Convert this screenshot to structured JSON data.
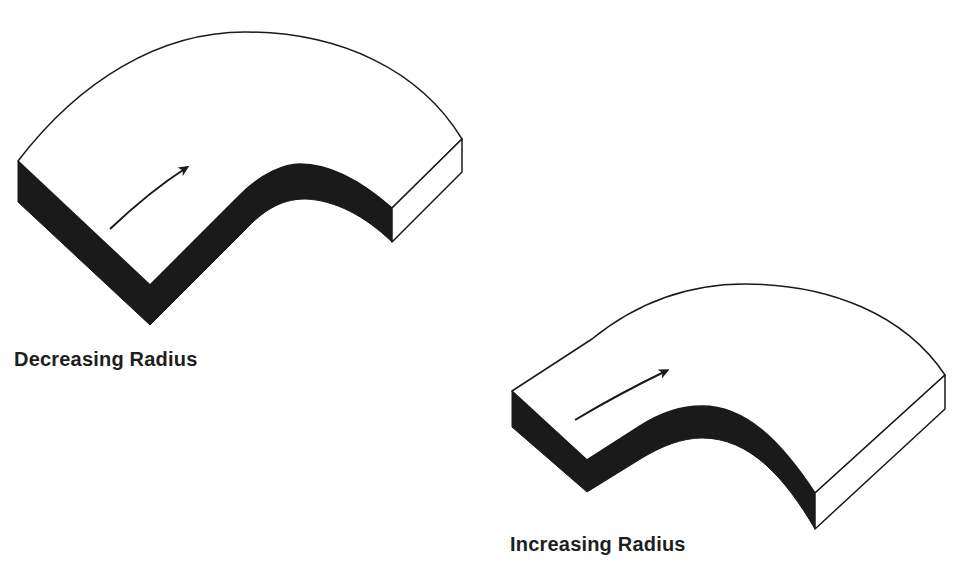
{
  "diagram": {
    "colors": {
      "top_face": "#ffffff",
      "side_face_dark": "#1a1a1a",
      "end_face": "#ffffff",
      "outline": "#1a1a1a",
      "text": "#1e1e1e"
    },
    "curves": [
      {
        "id": "decreasing",
        "label": "Decreasing Radius",
        "arrow_direction": "forward"
      },
      {
        "id": "increasing",
        "label": "Increasing Radius",
        "arrow_direction": "forward"
      }
    ]
  }
}
